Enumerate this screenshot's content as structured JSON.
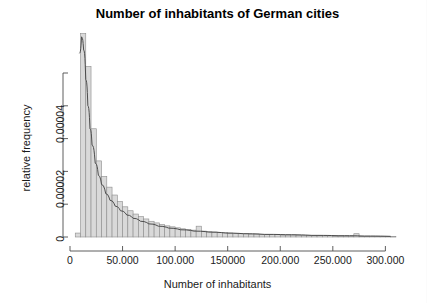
{
  "chart_data": {
    "type": "bar",
    "title": "Number of inhabitants of German cities",
    "xlabel": "Number of inhabitants",
    "ylabel": "relative frequency",
    "xlim": [
      0,
      312000
    ],
    "ylim": [
      0,
      5e-05
    ],
    "grid": false,
    "legend": null,
    "xtick_labels": [
      "0",
      "50.000",
      "100.000",
      "150000",
      "200.000",
      "250.000",
      "300.000"
    ],
    "xtick_values": [
      0,
      50000,
      100000,
      150000,
      200000,
      250000,
      300000
    ],
    "ytick_labels": [
      "0",
      "0.00002",
      "0.00004"
    ],
    "ytick_values": [
      0,
      2e-05,
      4e-05
    ],
    "ytick_minor_values": [
      1e-05,
      3e-05,
      5e-05
    ],
    "bin_width": 5000,
    "bar_fill": "#d9d9d9",
    "bar_stroke": "#8c8c8c",
    "density_stroke": "#4d4d4d",
    "note_clipped_peak": "tallest bar exceeds plotted y-range and is clipped at the top of the panel",
    "bin_starts": [
      5000,
      10000,
      15000,
      20000,
      25000,
      30000,
      35000,
      40000,
      45000,
      50000,
      55000,
      60000,
      65000,
      70000,
      75000,
      80000,
      85000,
      90000,
      95000,
      100000,
      105000,
      110000,
      115000,
      120000,
      125000,
      130000,
      135000,
      140000,
      145000,
      150000,
      155000,
      160000,
      165000,
      170000,
      175000,
      180000,
      185000,
      190000,
      195000,
      200000,
      205000,
      210000,
      215000,
      220000,
      225000,
      230000,
      235000,
      240000,
      245000,
      250000,
      255000,
      260000,
      265000,
      270000,
      275000,
      280000,
      285000,
      290000,
      295000,
      300000,
      305000
    ],
    "values": [
      1.2e-06,
      6.2e-05,
      5.2e-05,
      3.3e-05,
      2.32e-05,
      1.85e-05,
      1.52e-05,
      1.28e-05,
      1.08e-05,
      9.2e-06,
      8e-06,
      7e-06,
      6.2e-06,
      5.5e-06,
      4.8e-06,
      4.3e-06,
      3.8e-06,
      3.4e-06,
      3.1e-06,
      2.8e-06,
      2.5e-06,
      2.3e-06,
      2.1e-06,
      3.3e-06,
      1.8e-06,
      1.6e-06,
      1.5e-06,
      1.4e-06,
      1.3e-06,
      1.2e-06,
      1.1e-06,
      1e-06,
      1e-06,
      9e-07,
      9e-07,
      8e-07,
      8e-07,
      7e-07,
      7e-07,
      6e-07,
      6e-07,
      6e-07,
      5e-07,
      5e-07,
      5e-07,
      4e-07,
      4e-07,
      4e-07,
      4e-07,
      3e-07,
      3e-07,
      3e-07,
      3e-07,
      1e-06,
      2e-07,
      2e-07,
      2e-07,
      2e-07,
      2e-07,
      2e-07,
      1e-07
    ],
    "density_x": [
      9000,
      11000,
      13000,
      15000,
      17000,
      19000,
      21000,
      24000,
      27000,
      30000,
      34000,
      38000,
      43000,
      48000,
      54000,
      60000,
      67000,
      75000,
      84000,
      94000,
      105000,
      118000,
      132000,
      148000,
      165000,
      185000,
      205000,
      230000,
      255000,
      280000,
      305000
    ],
    "density_y": [
      5.6e-05,
      6.1e-05,
      5.7e-05,
      4.8e-05,
      4e-05,
      3.3e-05,
      2.8e-05,
      2.25e-05,
      1.88e-05,
      1.6e-05,
      1.32e-05,
      1.12e-05,
      9.4e-06,
      8e-06,
      6.7e-06,
      5.7e-06,
      4.8e-06,
      4e-06,
      3.3e-06,
      2.7e-06,
      2.2e-06,
      1.8e-06,
      1.5e-06,
      1.2e-06,
      1e-06,
      8e-07,
      7e-07,
      5e-07,
      4e-07,
      3e-07,
      2e-07
    ]
  }
}
